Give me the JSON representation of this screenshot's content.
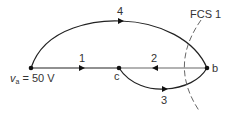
{
  "diagram": {
    "type": "signal-flow-graph",
    "nodes": [
      {
        "id": "a",
        "label": "v",
        "subscript": "a",
        "value_text": " = 50 V",
        "x": 31,
        "y": 68
      },
      {
        "id": "c",
        "label": "c",
        "x": 119,
        "y": 68
      },
      {
        "id": "b",
        "label": "b",
        "x": 207,
        "y": 68
      }
    ],
    "edges": [
      {
        "id": "1",
        "label": "1",
        "from": "a",
        "to": "c"
      },
      {
        "id": "2",
        "label": "2",
        "from": "b",
        "to": "c"
      },
      {
        "id": "3",
        "label": "3",
        "from": "c",
        "to": "b"
      },
      {
        "id": "4",
        "label": "4",
        "from": "a",
        "to": "b"
      }
    ],
    "cutset": {
      "label": "FCS 1"
    },
    "colors": {
      "line": "#222222",
      "text": "#333333",
      "cutset": "#555555"
    }
  }
}
